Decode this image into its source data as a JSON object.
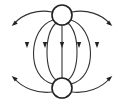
{
  "diagram": {
    "type": "field-lines-between-two-charges",
    "colors": {
      "background": "#ffffff",
      "line": "#333333",
      "charge_outline": "#222222",
      "charge_fill": "#ffffff"
    },
    "charges": [
      {
        "id": "top-charge",
        "cx": 62,
        "cy": 15,
        "r": 10
      },
      {
        "id": "bottom-charge",
        "cx": 62,
        "cy": 88,
        "r": 10
      }
    ],
    "field_lines": [
      {
        "id": "center",
        "d": "M62 25 L62 78",
        "arrow": {
          "x": 62,
          "y": 45,
          "dir": "down"
        }
      },
      {
        "id": "inner-left",
        "d": "M56 23 C44 34, 44 70, 56 80",
        "arrow": {
          "x": 45,
          "y": 45,
          "dir": "down"
        }
      },
      {
        "id": "inner-right",
        "d": "M68 23 C80 34, 80 70, 68 80",
        "arrow": {
          "x": 79,
          "y": 45,
          "dir": "down"
        }
      },
      {
        "id": "outer-left",
        "d": "M53 20 C28 28, 26 78, 53 84",
        "arrow": {
          "x": 27,
          "y": 45,
          "dir": "down"
        }
      },
      {
        "id": "outer-right",
        "d": "M71 20 C96 28, 98 78, 71 84",
        "arrow": {
          "x": 97,
          "y": 45,
          "dir": "down"
        }
      },
      {
        "id": "open-top-left",
        "d": "M52 12 C38 9, 22 14, 14 24",
        "arrow": {
          "x": 14,
          "y": 24,
          "dir": "down-left"
        }
      },
      {
        "id": "open-top-right",
        "d": "M72 12 C86 9, 102 14, 110 24",
        "arrow": {
          "x": 110,
          "y": 24,
          "dir": "down-right"
        }
      },
      {
        "id": "open-bottom-left",
        "d": "M52 92 C38 94, 22 88, 14 78",
        "arrow": {
          "x": 14,
          "y": 78,
          "dir": "up-left"
        }
      },
      {
        "id": "open-bottom-right",
        "d": "M72 92 C86 94, 102 88, 110 78",
        "arrow": {
          "x": 110,
          "y": 78,
          "dir": "up-right"
        }
      }
    ]
  }
}
